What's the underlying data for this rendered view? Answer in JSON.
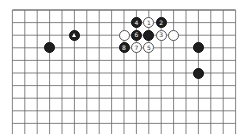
{
  "diagram": {
    "type": "go-board-partial",
    "grid": {
      "cols": 19,
      "rows_visible": 10,
      "origin_x": 12.4,
      "origin_y": 10,
      "spacing_x": 12.4,
      "spacing_y": 12.6,
      "top_edge_visible": true,
      "line_color": "#666666",
      "edge_color": "#333333"
    },
    "stones": [
      {
        "color": "black",
        "col": 5,
        "row": 2,
        "label": "",
        "marker": "triangle"
      },
      {
        "color": "black",
        "col": 3,
        "row": 3,
        "label": ""
      },
      {
        "color": "black",
        "col": 10,
        "row": 1,
        "label": "4"
      },
      {
        "color": "white",
        "col": 11,
        "row": 1,
        "label": "1"
      },
      {
        "color": "black",
        "col": 12,
        "row": 1,
        "label": "2"
      },
      {
        "color": "white",
        "col": 9,
        "row": 2,
        "label": ""
      },
      {
        "color": "black",
        "col": 10,
        "row": 2,
        "label": "6"
      },
      {
        "color": "black",
        "col": 11,
        "row": 2,
        "label": ""
      },
      {
        "color": "white",
        "col": 12,
        "row": 2,
        "label": "3"
      },
      {
        "color": "white",
        "col": 13,
        "row": 2,
        "label": ""
      },
      {
        "color": "black",
        "col": 9,
        "row": 3,
        "label": "8"
      },
      {
        "color": "white",
        "col": 10,
        "row": 3,
        "label": "7"
      },
      {
        "color": "white",
        "col": 11,
        "row": 3,
        "label": "5"
      },
      {
        "color": "black",
        "col": 15,
        "row": 3,
        "label": ""
      },
      {
        "color": "black",
        "col": 15,
        "row": 5,
        "label": ""
      }
    ]
  }
}
